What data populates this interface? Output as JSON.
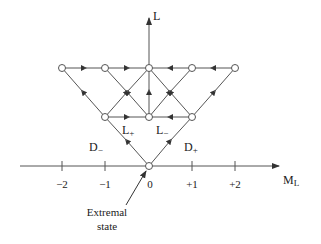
{
  "diagram": {
    "axis_vertical_label": "L",
    "axis_horizontal_label": "M",
    "axis_horizontal_sub": "L",
    "ticks": [
      "−2",
      "−1",
      "0",
      "+1",
      "+2"
    ],
    "labels": {
      "l_plus": "L",
      "l_plus_sub": "+",
      "l_minus": "L",
      "l_minus_sub": "−",
      "d_minus": "D",
      "d_minus_sub": "−",
      "d_plus": "D",
      "d_plus_sub": "+"
    },
    "caption_line1": "Extremal",
    "caption_line2": "state",
    "line_color": "#555555",
    "node_fill": "#ffffff"
  }
}
